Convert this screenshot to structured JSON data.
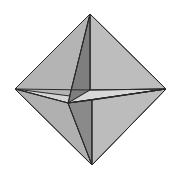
{
  "figure": {
    "background": "#ffffff",
    "colors": {
      "edge": "#2a2a2a",
      "face_light": "#c4c4c4",
      "face_mid": "#b0b0b0",
      "face_dark": "#7c7c7c",
      "face_pale": "#d6d6d6"
    },
    "vertices": {
      "top": [
        90,
        14
      ],
      "bottom": [
        92,
        165
      ],
      "left": [
        15,
        89
      ],
      "right": [
        166,
        89
      ],
      "center": [
        68,
        103
      ],
      "notch": [
        90,
        90
      ]
    }
  }
}
